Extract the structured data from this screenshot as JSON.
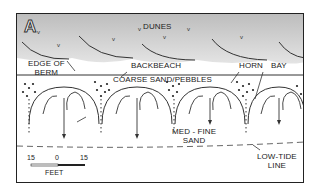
{
  "figure": {
    "panel_label": "A",
    "labels": {
      "dunes": "DUNES",
      "backbeach": "BACKBEACH",
      "edge_of_berm_1": "EDGE OF",
      "edge_of_berm_2": "BERM",
      "coarse": "COARSE SAND/PEBBLES",
      "horn": "HORN",
      "bay": "BAY",
      "med_fine_1": "MED - FINE",
      "med_fine_2": "SAND",
      "low_tide_1": "LOW-TIDE",
      "low_tide_2": "LINE"
    },
    "scale_bar": {
      "left": "15",
      "center": "0",
      "right": "15",
      "unit": "FEET"
    },
    "colors": {
      "dune_fill": "#c8c8c8",
      "line": "#222222",
      "frame": "#222222"
    }
  }
}
